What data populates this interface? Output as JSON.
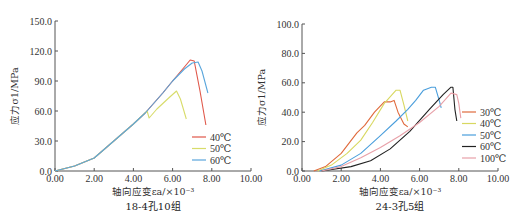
{
  "chart_data": [
    {
      "type": "line",
      "caption": "18-4孔10组",
      "xlabel": "轴向应变εa/×10⁻³",
      "ylabel": "应力σ1/MPa",
      "xlim": [
        0,
        10
      ],
      "ylim": [
        0,
        150
      ],
      "xticks": [
        "0.00",
        "2.00",
        "4.00",
        "6.00",
        "8.00",
        "10.00"
      ],
      "yticks": [
        "0.0",
        "30.0",
        "60.0",
        "90.0",
        "120.0",
        "150.0"
      ],
      "grid": false,
      "legend_position": "lower right",
      "series": [
        {
          "name": "40℃",
          "color": "#e0584a",
          "points": [
            [
              0,
              0
            ],
            [
              1.0,
              5
            ],
            [
              2.0,
              13
            ],
            [
              3.0,
              30
            ],
            [
              4.0,
              47
            ],
            [
              4.6,
              58
            ],
            [
              5.5,
              78
            ],
            [
              6.0,
              90
            ],
            [
              6.6,
              104
            ],
            [
              6.9,
              111
            ],
            [
              7.1,
              110
            ],
            [
              7.4,
              80
            ],
            [
              7.7,
              46
            ]
          ]
        },
        {
          "name": "50℃",
          "color": "#d8dc6a",
          "points": [
            [
              0,
              0
            ],
            [
              1.0,
              5
            ],
            [
              2.0,
              13
            ],
            [
              3.0,
              30
            ],
            [
              4.0,
              47
            ],
            [
              4.7,
              60
            ],
            [
              4.8,
              53
            ],
            [
              5.2,
              62
            ],
            [
              5.8,
              73
            ],
            [
              6.2,
              80
            ],
            [
              6.4,
              72
            ],
            [
              6.7,
              52
            ]
          ]
        },
        {
          "name": "60℃",
          "color": "#5aa6dc",
          "points": [
            [
              0,
              0
            ],
            [
              1.0,
              5
            ],
            [
              2.0,
              13
            ],
            [
              3.0,
              30
            ],
            [
              4.0,
              47
            ],
            [
              4.6,
              58
            ],
            [
              5.5,
              78
            ],
            [
              6.0,
              90
            ],
            [
              6.6,
              102
            ],
            [
              7.0,
              108
            ],
            [
              7.3,
              109
            ],
            [
              7.5,
              100
            ],
            [
              7.8,
              78
            ]
          ]
        }
      ]
    },
    {
      "type": "line",
      "caption": "24-3孔5组",
      "xlabel": "轴向应变εa/×10⁻³",
      "ylabel": "应力σ1/MPa",
      "xlim": [
        0,
        10
      ],
      "ylim": [
        0,
        100
      ],
      "xticks": [
        "0.00",
        "2.00",
        "4.00",
        "6.00",
        "8.00",
        "10.00"
      ],
      "yticks": [
        "0.0",
        "20.0",
        "40.0",
        "60.0",
        "80.0",
        "100.0"
      ],
      "grid": false,
      "legend_position": "lower right",
      "series": [
        {
          "name": "30℃",
          "color": "#e06a3c",
          "points": [
            [
              0.6,
              0
            ],
            [
              1.2,
              3
            ],
            [
              2.0,
              12
            ],
            [
              2.8,
              26
            ],
            [
              3.2,
              31
            ],
            [
              3.7,
              40
            ],
            [
              4.2,
              47
            ],
            [
              4.5,
              47
            ],
            [
              4.7,
              48
            ],
            [
              4.9,
              40
            ],
            [
              5.2,
              32
            ],
            [
              5.4,
              30
            ]
          ]
        },
        {
          "name": "40℃",
          "color": "#d8d860",
          "points": [
            [
              0.8,
              0
            ],
            [
              1.5,
              4
            ],
            [
              2.3,
              12
            ],
            [
              3.0,
              21
            ],
            [
              3.6,
              33
            ],
            [
              4.2,
              46
            ],
            [
              4.8,
              55
            ],
            [
              5.0,
              55
            ],
            [
              5.2,
              45
            ],
            [
              5.4,
              34
            ]
          ]
        },
        {
          "name": "50℃",
          "color": "#4a9edc",
          "points": [
            [
              0.9,
              0
            ],
            [
              2.0,
              4
            ],
            [
              3.0,
              12
            ],
            [
              4.0,
              24
            ],
            [
              4.8,
              34
            ],
            [
              5.4,
              42
            ],
            [
              5.8,
              48
            ],
            [
              6.2,
              55
            ],
            [
              6.6,
              57
            ],
            [
              6.8,
              57
            ],
            [
              7.0,
              48
            ],
            [
              7.1,
              43
            ]
          ]
        },
        {
          "name": "60℃",
          "color": "#222222",
          "points": [
            [
              1.0,
              0
            ],
            [
              2.5,
              3
            ],
            [
              3.5,
              7
            ],
            [
              4.5,
              15
            ],
            [
              5.5,
              27
            ],
            [
              6.5,
              42
            ],
            [
              7.2,
              52
            ],
            [
              7.6,
              57
            ],
            [
              7.7,
              57
            ],
            [
              7.8,
              42
            ],
            [
              7.9,
              34
            ]
          ]
        },
        {
          "name": "100℃",
          "color": "#e8a0a8",
          "points": [
            [
              1.0,
              0
            ],
            [
              2.0,
              3
            ],
            [
              3.0,
              9
            ],
            [
              4.0,
              16
            ],
            [
              5.0,
              24
            ],
            [
              6.0,
              33
            ],
            [
              7.0,
              44
            ],
            [
              7.6,
              53
            ],
            [
              7.9,
              52
            ],
            [
              8.0,
              46
            ],
            [
              8.1,
              36
            ]
          ]
        }
      ]
    }
  ],
  "layout": [
    {
      "x0": 55,
      "y0": 171,
      "xpx": 19.6,
      "ypx": 1.0,
      "legend_x": 192,
      "legend_y": 137
    },
    {
      "x0": 302,
      "y0": 171,
      "xpx": 19.6,
      "ypx": 1.47,
      "legend_x": 462,
      "legend_y": 112
    }
  ]
}
